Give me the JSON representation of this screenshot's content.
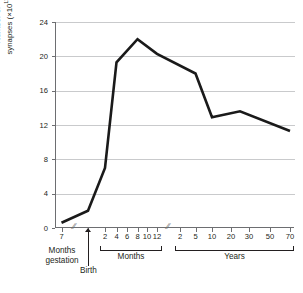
{
  "chart_data": {
    "type": "line",
    "title": "",
    "subtitle": "",
    "ylabel_line1": "Number of",
    "ylabel_line2": "synapses",
    "ylabel_units_prefix": "(×10",
    "ylabel_units_exp": "11",
    "ylabel_units_suffix": ")",
    "ylabel_full": "Number of synapses (×10¹¹)",
    "xlabel": "",
    "ylim": [
      0,
      24
    ],
    "yticks": [
      0,
      4,
      8,
      12,
      16,
      20,
      24
    ],
    "ytick_labels": [
      "0",
      "4",
      "8",
      "12",
      "16",
      "20",
      "24"
    ],
    "grid": true,
    "grid_axis": "y",
    "legend": "none",
    "axis_breaks": [
      "between gestation segment and birth",
      "between 12 months and 2 years"
    ],
    "break_glyph": "//",
    "x_segments": [
      {
        "name": "gestation",
        "group_label": "Months gestation",
        "group_label_line1": "Months",
        "group_label_line2": "gestation",
        "tick_labels": [
          "7"
        ],
        "bracket": false
      },
      {
        "name": "birth",
        "group_label": "Birth",
        "tick_labels": [],
        "marker": "arrow",
        "bracket": false
      },
      {
        "name": "months",
        "group_label": "Months",
        "tick_labels": [
          "2",
          "4",
          "6",
          "8",
          "10",
          "12"
        ],
        "bracket": true
      },
      {
        "name": "years",
        "group_label": "Years",
        "tick_labels": [
          "2",
          "5",
          "10",
          "20",
          "30",
          "50",
          "70"
        ],
        "bracket": true
      }
    ],
    "series": [
      {
        "name": "Number of synapses",
        "color": "#1a1a1a",
        "points": [
          {
            "x_label": "7 months gestation",
            "value": 0.6
          },
          {
            "x_label": "Birth",
            "value": 2.0
          },
          {
            "x_label": "2 months",
            "value": 7.0
          },
          {
            "x_label": "4 months",
            "value": 19.3
          },
          {
            "x_label": "8 months",
            "value": 22.0
          },
          {
            "x_label": "12 months",
            "value": 20.3
          },
          {
            "x_label": "5 years",
            "value": 18.0
          },
          {
            "x_label": "10 years",
            "value": 12.9
          },
          {
            "x_label": "25 years",
            "value": 13.6
          },
          {
            "x_label": "70 years",
            "value": 11.3
          }
        ]
      }
    ]
  },
  "colors": {
    "line": "#1a1a1a",
    "grid": "#c9cacc",
    "axis": "#6d6e71",
    "text": "#231f20",
    "background": "#ffffff"
  }
}
